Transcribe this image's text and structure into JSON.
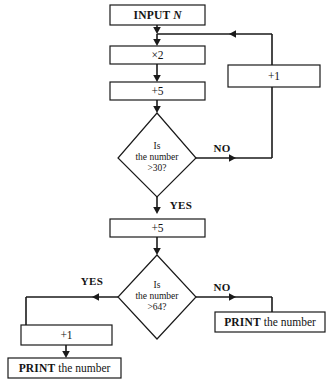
{
  "diagram": {
    "type": "flowchart",
    "background_color": "#ffffff",
    "line_color": "#1a1a1a",
    "text_color": "#141414"
  },
  "nodes": {
    "input": {
      "shape": "process-box",
      "keyword": "INPUT",
      "variable": "N"
    },
    "multiply": {
      "shape": "process-box",
      "label": "×2"
    },
    "add_five_first": {
      "shape": "process-box",
      "label": "+5"
    },
    "increment_loop": {
      "shape": "process-box",
      "label": "+1"
    },
    "decision_thirty": {
      "shape": "diamond",
      "line1": "Is",
      "line2": "the number",
      "line3": ">30?"
    },
    "add_five_second": {
      "shape": "process-box",
      "label": "+5"
    },
    "decision_sixty_four": {
      "shape": "diamond",
      "line1": "Is",
      "line2": "the number",
      "line3": ">64?"
    },
    "increment_yes": {
      "shape": "process-box",
      "label": "+1"
    },
    "print_left": {
      "shape": "process-box",
      "keyword": "PRINT",
      "rest": " the number"
    },
    "print_right": {
      "shape": "process-box",
      "keyword": "PRINT",
      "rest": " the number"
    }
  },
  "branch_labels": {
    "thirty_no": "NO",
    "thirty_yes": "YES",
    "sixty_four_yes": "YES",
    "sixty_four_no": "NO"
  }
}
